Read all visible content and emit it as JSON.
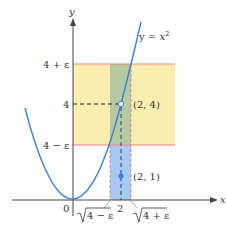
{
  "figure": {
    "axes": {
      "x_label": "x",
      "y_label": "y",
      "origin_label": "0"
    },
    "curve": {
      "label_prefix": "y = ",
      "label_var": "x",
      "label_exp": "2",
      "color": "#3a7fd5"
    },
    "y_ticks": {
      "upper": "4 + ε",
      "mid": "4",
      "lower": "4 − ε"
    },
    "x_ticks": {
      "left": "4 − ε",
      "mid": "2",
      "right": "4 + ε"
    },
    "points": {
      "on_curve": "(2, 4)",
      "below": "(2, 1)"
    },
    "colors": {
      "epsilon_band": "#fbeeb0",
      "epsilon_band_border": "#e8838f",
      "delta_band_upper": "#b7c9a0",
      "delta_band_lower": "#a9c8f2",
      "point_fill": "#3a7fd5"
    }
  }
}
